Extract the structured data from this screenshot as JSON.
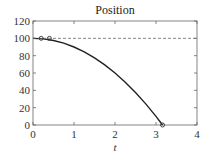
{
  "chart_data": {
    "type": "line",
    "title": "Position",
    "xlabel": "t",
    "ylabel": "",
    "xlim": [
      0,
      4
    ],
    "ylim": [
      0,
      120
    ],
    "xticks": [
      0,
      1,
      2,
      3,
      4
    ],
    "yticks": [
      0,
      20,
      40,
      60,
      80,
      100,
      120
    ],
    "grid": false,
    "series": [
      {
        "name": "position",
        "style": "solid",
        "x": [
          0,
          0.25,
          0.5,
          0.75,
          1.0,
          1.25,
          1.5,
          1.75,
          2.0,
          2.25,
          2.5,
          2.75,
          3.0,
          3.16
        ],
        "y": [
          100,
          99.4,
          97.5,
          94.4,
          90,
          84.4,
          77.5,
          69.4,
          60,
          49.4,
          37.5,
          24.4,
          10,
          0
        ]
      },
      {
        "name": "reference",
        "style": "dashed",
        "x": [
          0,
          4
        ],
        "y": [
          100,
          100
        ]
      },
      {
        "name": "markers",
        "style": "circle-markers",
        "x": [
          0.2,
          0.4,
          3.16
        ],
        "y": [
          100,
          100,
          0
        ]
      }
    ]
  }
}
